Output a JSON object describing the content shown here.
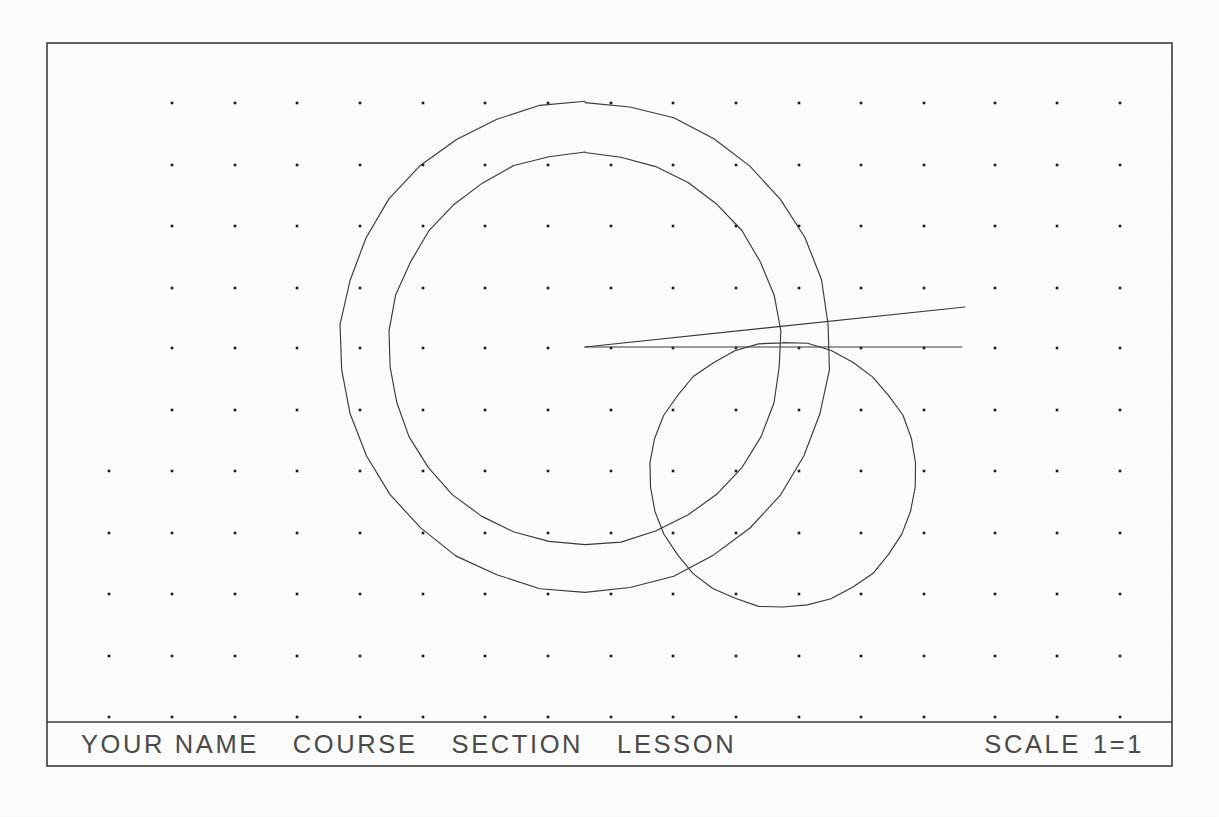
{
  "document": {
    "type": "cad-drawing-sheet",
    "background_color": "#fdfdfc",
    "ink_color": "#3a3a3a",
    "sheet_width": 1219,
    "sheet_height": 817
  },
  "border": {
    "outer": {
      "x": 47,
      "y": 43,
      "width": 1125,
      "height": 723
    },
    "title_block_divider_y": 722,
    "stroke_color": "#3d3d3d",
    "stroke_width": 1.6
  },
  "grid": {
    "label": "snap-grid-dots",
    "dot_color": "#1b1b1b",
    "dot_size": 2.6,
    "spacing_x": 62.6,
    "spacing_y": 61.4,
    "columns_x": [
      109,
      172,
      235,
      297,
      360,
      423,
      485,
      548,
      611,
      673,
      736,
      799,
      861,
      924,
      995,
      1057,
      1120
    ],
    "rows_y": [
      103,
      165,
      226,
      288,
      348,
      410,
      471,
      533,
      594,
      656,
      717
    ],
    "clipped_left_column_note": "left-most column visible only on lower rows"
  },
  "geometry": {
    "circles": [
      {
        "name": "outer-concentric-circle",
        "cx": 585,
        "cy": 347,
        "r": 245,
        "label": "Outer circle"
      },
      {
        "name": "inner-concentric-circle",
        "cx": 585,
        "cy": 349,
        "r": 196,
        "label": "Inner circle"
      },
      {
        "name": "small-offset-circle",
        "cx": 783,
        "cy": 475,
        "r": 133,
        "label": "Small circle"
      }
    ],
    "lines": [
      {
        "name": "horizontal-construction-line",
        "x1": 585,
        "y1": 347,
        "x2": 962,
        "y2": 347,
        "label": "Horizontal ray"
      },
      {
        "name": "angled-construction-line",
        "x1": 585,
        "y1": 347,
        "x2": 965,
        "y2": 307,
        "label": "Angled ray"
      }
    ],
    "vertex": {
      "name": "ray-origin-vertex",
      "x": 585,
      "y": 347
    }
  },
  "title_block": {
    "name_field": "YOUR NAME",
    "course_field": "COURSE",
    "section_field": "SECTION",
    "lesson_field": "LESSON",
    "scale_label": "SCALE",
    "scale_value": "1=1"
  }
}
